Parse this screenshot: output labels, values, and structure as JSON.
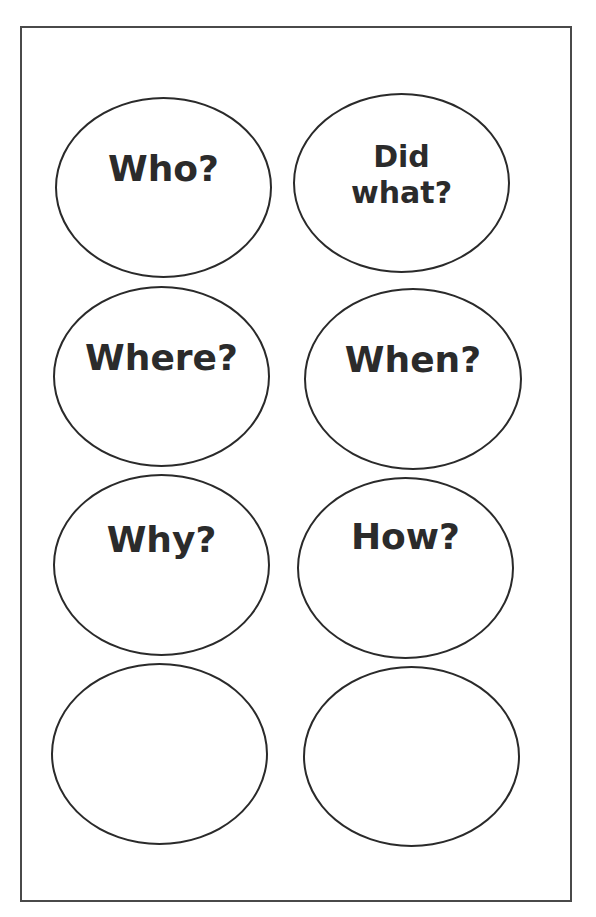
{
  "worksheet": {
    "bubbles": [
      {
        "label": "Who?",
        "x": 55,
        "y": 97,
        "w": 217,
        "h": 181,
        "label_top": 52
      },
      {
        "label": "Did\nwhat?",
        "x": 293,
        "y": 93,
        "w": 217,
        "h": 180,
        "label_top": 44,
        "two_line": true
      },
      {
        "label": "Where?",
        "x": 53,
        "y": 286,
        "w": 217,
        "h": 181,
        "label_top": 52
      },
      {
        "label": "When?",
        "x": 304,
        "y": 288,
        "w": 218,
        "h": 182,
        "label_top": 52
      },
      {
        "label": "Why?",
        "x": 53,
        "y": 474,
        "w": 217,
        "h": 182,
        "label_top": 46
      },
      {
        "label": "How?",
        "x": 297,
        "y": 477,
        "w": 217,
        "h": 182,
        "label_top": 40
      },
      {
        "label": "",
        "x": 51,
        "y": 663,
        "w": 217,
        "h": 182,
        "label_top": 50
      },
      {
        "label": "",
        "x": 303,
        "y": 666,
        "w": 217,
        "h": 181,
        "label_top": 50
      }
    ]
  }
}
